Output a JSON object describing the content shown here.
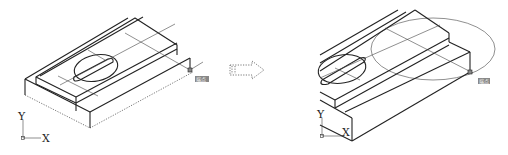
{
  "figure": {
    "left_panel": {
      "name": "before",
      "axes": {
        "x_label": "X",
        "y_label": "Y"
      },
      "grip_label": "端点",
      "base_outline": "dotted"
    },
    "transition_arrow": {
      "style": "dotted-hollow",
      "direction": "right"
    },
    "right_panel": {
      "name": "after",
      "axes": {
        "x_label": "X",
        "y_label": "Y"
      },
      "grip_label": "端点",
      "zoom_circle": true
    }
  },
  "colors": {
    "line": "#222222",
    "grip_fill": "#888888",
    "background": "#ffffff"
  }
}
